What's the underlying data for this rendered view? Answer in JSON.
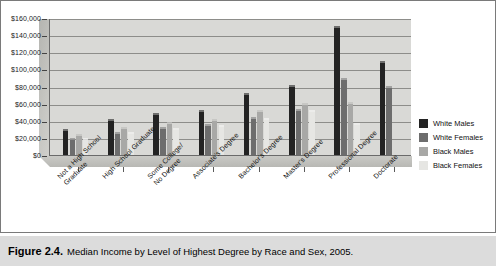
{
  "figure": {
    "caption_number": "Figure 2.4.",
    "caption_text": "Median Income by Level of Highest Degree by Race and Sex, 2005."
  },
  "legend": {
    "position": "right",
    "entries": [
      {
        "label": "White Males",
        "color": "#232323"
      },
      {
        "label": "White Females",
        "color": "#6d6d6d"
      },
      {
        "label": "Black Males",
        "color": "#a8a8a6"
      },
      {
        "label": "Black Females",
        "color": "#e6e6e3"
      }
    ]
  },
  "yaxis": {
    "ticks": [
      "$160,000",
      "$140,000",
      "$120,000",
      "$100,000",
      "$80,000",
      "$60,000",
      "$40,000",
      "$20,000",
      "$0"
    ]
  },
  "chart_data": {
    "type": "bar",
    "title": "Median Income by Level of Highest Degree by Race and Sex, 2005",
    "xlabel": "",
    "ylabel": "",
    "ylim": [
      0,
      160000
    ],
    "ytick_step": 20000,
    "grid": true,
    "legend_position": "right",
    "categories": [
      "Not a High School\nGraduate",
      "High School Graduate",
      "Some College/\nNo Degree",
      "Associate's Degree",
      "Bachelor's Degree",
      "Master's Degree",
      "Professional Degree",
      "Doctorate"
    ],
    "series": [
      {
        "name": "White Males",
        "values": [
          28000,
          40000,
          47000,
          50000,
          70000,
          80000,
          148000,
          108000
        ]
      },
      {
        "name": "White Females",
        "values": [
          17000,
          25000,
          30000,
          34000,
          42000,
          51000,
          88000,
          78000
        ]
      },
      {
        "name": "Black Males",
        "values": [
          22000,
          30000,
          36000,
          40000,
          50000,
          58000,
          60000,
          0
        ]
      },
      {
        "name": "Black Females",
        "values": [
          18000,
          24000,
          29000,
          33000,
          41000,
          50000,
          35000,
          0
        ]
      }
    ]
  }
}
